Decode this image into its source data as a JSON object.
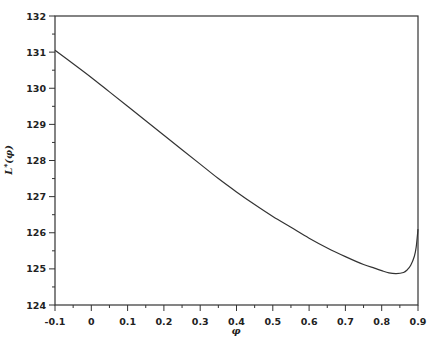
{
  "chart_data": {
    "type": "line",
    "title": "",
    "xlabel": "φ",
    "ylabel": "L*(φ)",
    "xlim": [
      -0.1,
      0.9
    ],
    "ylim": [
      124,
      132
    ],
    "grid": false,
    "legend": null,
    "x_ticks": [
      "-0.1",
      "0",
      "0.1",
      "0.2",
      "0.3",
      "0.4",
      "0.5",
      "0.6",
      "0.7",
      "0.8",
      "0.9"
    ],
    "y_ticks": [
      "124",
      "125",
      "126",
      "127",
      "128",
      "129",
      "130",
      "131",
      "132"
    ],
    "series": [
      {
        "name": "L*(φ)",
        "x": [
          -0.1,
          -0.05,
          0.0,
          0.05,
          0.1,
          0.15,
          0.2,
          0.25,
          0.3,
          0.35,
          0.4,
          0.45,
          0.5,
          0.55,
          0.6,
          0.65,
          0.7,
          0.75,
          0.78,
          0.8,
          0.82,
          0.84,
          0.86,
          0.87,
          0.88,
          0.89,
          0.895,
          0.9
        ],
        "values": [
          131.05,
          130.68,
          130.3,
          129.9,
          129.5,
          129.1,
          128.7,
          128.3,
          127.9,
          127.5,
          127.13,
          126.78,
          126.45,
          126.15,
          125.85,
          125.58,
          125.34,
          125.12,
          125.02,
          124.95,
          124.89,
          124.87,
          124.9,
          124.97,
          125.1,
          125.35,
          125.6,
          126.1
        ]
      }
    ]
  },
  "labels": {
    "x_axis": "φ",
    "y_axis_main": "L",
    "y_axis_super": "*",
    "y_axis_arg": "(φ)"
  }
}
